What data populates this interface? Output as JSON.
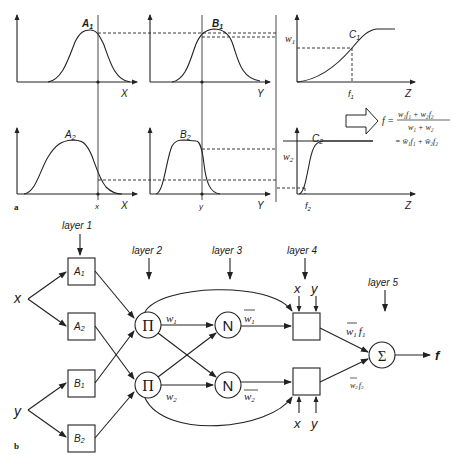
{
  "panel_a": {
    "label": "a",
    "charts": {
      "A1": {
        "label_main": "A",
        "label_sub": "1",
        "axis": "X"
      },
      "B1": {
        "label_main": "B",
        "label_sub": "1",
        "axis": "Y"
      },
      "C1": {
        "label_main": "C",
        "label_sub": "1",
        "axis": "Z",
        "w_label": "w",
        "w_sub": "1",
        "f_label": "f",
        "f_sub": "1"
      },
      "A2": {
        "label_main": "A",
        "label_sub": "2",
        "axis": "X",
        "input": "x"
      },
      "B2": {
        "label_main": "B",
        "label_sub": "2",
        "axis": "Y",
        "input": "y"
      },
      "C2": {
        "label_main": "C",
        "label_sub": "2",
        "axis": "Z",
        "w_label": "w",
        "w_sub": "2",
        "f_label": "f",
        "f_sub": "2"
      }
    },
    "formula": {
      "lhs": "f =",
      "numerator": "w₁f₁ + w₂f₂",
      "denominator": "w₁ + w₂",
      "line2": "= w̄₁f₁ + w̄₂f₂"
    }
  },
  "panel_b": {
    "label": "b",
    "layers": [
      "layer 1",
      "layer 2",
      "layer 3",
      "layer 4",
      "layer 5"
    ],
    "inputs": {
      "x": "x",
      "y": "y"
    },
    "layer1_nodes": [
      {
        "main": "A",
        "sub": "1"
      },
      {
        "main": "A",
        "sub": "2"
      },
      {
        "main": "B",
        "sub": "1"
      },
      {
        "main": "B",
        "sub": "2"
      }
    ],
    "layer2_nodes": [
      "Π",
      "Π"
    ],
    "layer3_nodes": [
      "N",
      "N"
    ],
    "layer5_node": "Σ",
    "edge_labels": {
      "w1": {
        "main": "w",
        "sub": "1"
      },
      "w2": {
        "main": "w",
        "sub": "2"
      },
      "w1bar": {
        "main": "w",
        "sub": "1"
      },
      "w2bar": {
        "main": "w",
        "sub": "2"
      },
      "w1f1": {
        "w": "w",
        "ws": "1",
        "f": "f",
        "fs": "1"
      },
      "w2f2": {
        "w": "w",
        "ws": "2",
        "f": "f",
        "fs": "2"
      }
    },
    "layer4_inputs_top": [
      "x",
      "y"
    ],
    "layer4_inputs_bottom": [
      "x",
      "y"
    ],
    "output": "f"
  }
}
